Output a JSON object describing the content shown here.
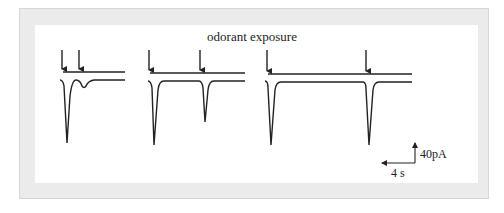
{
  "figure": {
    "title": "odorant exposure",
    "scale_bar": {
      "current_label": "40pA",
      "time_label": "4 s"
    },
    "colors": {
      "frame": "#ebebeb",
      "panel": "#ffffff",
      "trace": "#222222"
    },
    "traces": [
      {
        "id": "pair-short-interval",
        "stimulus_arrows": 2,
        "first_response_amplitude": "large",
        "second_response_amplitude": "small"
      },
      {
        "id": "pair-medium-interval",
        "stimulus_arrows": 2,
        "first_response_amplitude": "large",
        "second_response_amplitude": "medium"
      },
      {
        "id": "pair-long-interval",
        "stimulus_arrows": 2,
        "first_response_amplitude": "large",
        "second_response_amplitude": "large"
      }
    ]
  }
}
